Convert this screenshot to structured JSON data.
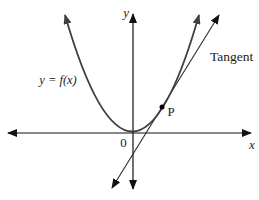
{
  "figure": {
    "labels": {
      "y_axis": "y",
      "x_axis": "x",
      "origin": "0",
      "curve": "y = f(x)",
      "point": "P",
      "tangent": "Tangent"
    },
    "colors": {
      "background": "#ffffff",
      "axis": "#111111",
      "curve": "#3f3f3f",
      "tangent_line": "#2a2a2a",
      "point": "#000000",
      "text": "#1c1c1c"
    }
  }
}
